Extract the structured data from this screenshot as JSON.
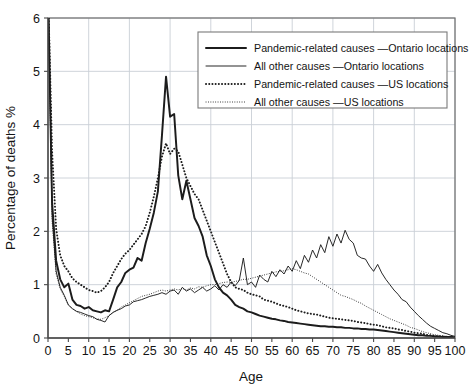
{
  "chart_data": {
    "type": "line",
    "title": "",
    "xlabel": "Age",
    "ylabel": "Percentage of deaths %",
    "xlim": [
      0,
      100
    ],
    "ylim": [
      0,
      6
    ],
    "xticks": [
      0,
      5,
      10,
      15,
      20,
      25,
      30,
      35,
      40,
      45,
      50,
      55,
      60,
      65,
      70,
      75,
      80,
      85,
      90,
      95,
      100
    ],
    "yticks": [
      0,
      1,
      2,
      3,
      4,
      5,
      6
    ],
    "xtick_labels": [
      "0",
      "5",
      "10",
      "15",
      "20",
      "25",
      "30",
      "35",
      "40",
      "45",
      "50",
      "55",
      "60",
      "65",
      "70",
      "75",
      "80",
      "85",
      "90",
      "95",
      "100"
    ],
    "ytick_labels": [
      "0",
      "1",
      "2",
      "3",
      "4",
      "5",
      "6"
    ],
    "grid": "both-major-10yr-and-1pct",
    "legend_position": "top-right-inside",
    "x": [
      0,
      1,
      2,
      3,
      4,
      5,
      6,
      7,
      8,
      9,
      10,
      11,
      12,
      13,
      14,
      15,
      16,
      17,
      18,
      19,
      20,
      21,
      22,
      23,
      24,
      25,
      26,
      27,
      28,
      29,
      30,
      31,
      32,
      33,
      34,
      35,
      36,
      37,
      38,
      39,
      40,
      41,
      42,
      43,
      44,
      45,
      46,
      47,
      48,
      49,
      50,
      51,
      52,
      53,
      54,
      55,
      56,
      57,
      58,
      59,
      60,
      61,
      62,
      63,
      64,
      65,
      66,
      67,
      68,
      69,
      70,
      71,
      72,
      73,
      74,
      75,
      76,
      77,
      78,
      79,
      80,
      81,
      82,
      83,
      84,
      85,
      86,
      87,
      88,
      89,
      90,
      91,
      92,
      93,
      94,
      95,
      96,
      97,
      98,
      99,
      100
    ],
    "series": [
      {
        "name": "Pandemic-related causes — Ontario locations",
        "style": "thick-solid",
        "color": "#1c1c1c",
        "values": [
          6.6,
          2.55,
          1.45,
          1.1,
          0.95,
          1.02,
          0.72,
          0.62,
          0.6,
          0.55,
          0.58,
          0.52,
          0.5,
          0.48,
          0.52,
          0.5,
          0.72,
          0.95,
          1.05,
          1.22,
          1.28,
          1.32,
          1.5,
          1.45,
          1.78,
          2.05,
          2.35,
          2.75,
          3.8,
          4.9,
          4.15,
          4.2,
          3.05,
          2.6,
          2.95,
          2.6,
          2.25,
          2.1,
          1.9,
          1.55,
          1.35,
          1.1,
          0.95,
          0.85,
          0.8,
          0.72,
          0.62,
          0.58,
          0.55,
          0.5,
          0.48,
          0.45,
          0.42,
          0.4,
          0.38,
          0.36,
          0.35,
          0.33,
          0.32,
          0.3,
          0.29,
          0.28,
          0.27,
          0.26,
          0.25,
          0.24,
          0.23,
          0.22,
          0.22,
          0.21,
          0.21,
          0.2,
          0.2,
          0.19,
          0.19,
          0.18,
          0.18,
          0.17,
          0.17,
          0.16,
          0.16,
          0.15,
          0.14,
          0.13,
          0.12,
          0.11,
          0.1,
          0.09,
          0.08,
          0.07,
          0.06,
          0.05,
          0.05,
          0.04,
          0.04,
          0.03,
          0.03,
          0.02,
          0.02,
          0.02,
          0.01
        ]
      },
      {
        "name": "All other causes — Ontario locations",
        "style": "thin-solid",
        "color": "#1c1c1c",
        "values": [
          6.6,
          2.3,
          1.25,
          0.95,
          0.8,
          0.62,
          0.55,
          0.5,
          0.48,
          0.45,
          0.42,
          0.4,
          0.35,
          0.33,
          0.3,
          0.42,
          0.48,
          0.52,
          0.55,
          0.6,
          0.62,
          0.68,
          0.7,
          0.72,
          0.75,
          0.78,
          0.8,
          0.82,
          0.85,
          0.82,
          0.88,
          0.9,
          0.82,
          0.95,
          0.88,
          0.92,
          0.85,
          0.9,
          0.95,
          0.88,
          0.92,
          0.98,
          0.9,
          1.0,
          0.95,
          1.05,
          0.98,
          1.08,
          1.5,
          1.0,
          1.05,
          0.95,
          1.18,
          1.1,
          1.05,
          1.25,
          1.15,
          1.28,
          1.2,
          1.35,
          1.25,
          1.45,
          1.3,
          1.55,
          1.42,
          1.65,
          1.5,
          1.75,
          1.6,
          1.9,
          1.72,
          1.95,
          1.78,
          2.02,
          1.85,
          1.78,
          1.55,
          1.5,
          1.48,
          1.35,
          1.25,
          1.38,
          1.22,
          1.1,
          1.0,
          0.9,
          0.82,
          0.72,
          0.68,
          0.58,
          0.5,
          0.42,
          0.35,
          0.28,
          0.22,
          0.18,
          0.14,
          0.1,
          0.08,
          0.05,
          0.03
        ]
      },
      {
        "name": "Pandemic-related causes — US locations",
        "style": "thick-dotted",
        "color": "#1c1c1c",
        "values": [
          6.6,
          3.5,
          2.05,
          1.55,
          1.35,
          1.25,
          1.12,
          1.05,
          1.0,
          0.95,
          0.9,
          0.88,
          0.85,
          0.88,
          0.95,
          1.05,
          1.22,
          1.35,
          1.48,
          1.58,
          1.65,
          1.75,
          1.85,
          1.95,
          2.1,
          2.35,
          2.65,
          3.0,
          3.4,
          3.65,
          3.45,
          3.55,
          3.5,
          3.25,
          3.0,
          2.85,
          2.7,
          2.6,
          2.4,
          2.2,
          2.0,
          1.8,
          1.6,
          1.4,
          1.2,
          1.05,
          0.95,
          0.92,
          0.9,
          0.85,
          0.82,
          0.8,
          0.78,
          0.72,
          0.7,
          0.68,
          0.65,
          0.62,
          0.6,
          0.58,
          0.55,
          0.52,
          0.5,
          0.48,
          0.46,
          0.45,
          0.44,
          0.42,
          0.4,
          0.38,
          0.37,
          0.36,
          0.35,
          0.34,
          0.33,
          0.32,
          0.3,
          0.29,
          0.28,
          0.26,
          0.25,
          0.24,
          0.22,
          0.2,
          0.19,
          0.18,
          0.16,
          0.15,
          0.13,
          0.12,
          0.1,
          0.09,
          0.08,
          0.06,
          0.05,
          0.04,
          0.03,
          0.03,
          0.02,
          0.02,
          0.01
        ]
      },
      {
        "name": "All other causes — US locations",
        "style": "thin-dotted",
        "color": "#1c1c1c",
        "values": [
          6.6,
          2.2,
          1.2,
          0.92,
          0.78,
          0.62,
          0.55,
          0.5,
          0.45,
          0.42,
          0.4,
          0.38,
          0.36,
          0.35,
          0.38,
          0.42,
          0.48,
          0.52,
          0.58,
          0.62,
          0.66,
          0.7,
          0.74,
          0.78,
          0.8,
          0.82,
          0.85,
          0.88,
          0.9,
          0.88,
          0.9,
          0.92,
          0.9,
          0.93,
          0.9,
          0.94,
          0.92,
          0.96,
          0.95,
          0.98,
          1.0,
          1.0,
          1.02,
          1.04,
          1.05,
          1.05,
          1.06,
          1.08,
          1.1,
          1.1,
          1.12,
          1.14,
          1.16,
          1.18,
          1.2,
          1.22,
          1.24,
          1.25,
          1.26,
          1.28,
          1.3,
          1.28,
          1.25,
          1.22,
          1.2,
          1.15,
          1.1,
          1.05,
          1.0,
          0.95,
          0.9,
          0.85,
          0.8,
          0.78,
          0.75,
          0.72,
          0.68,
          0.65,
          0.6,
          0.56,
          0.52,
          0.48,
          0.44,
          0.4,
          0.36,
          0.33,
          0.3,
          0.27,
          0.24,
          0.2,
          0.18,
          0.15,
          0.12,
          0.1,
          0.08,
          0.06,
          0.05,
          0.04,
          0.03,
          0.02,
          0.01
        ]
      }
    ],
    "legend_entries": [
      {
        "label": "Pandemic-related causes —Ontario locations",
        "style": "thick-solid"
      },
      {
        "label": "All other causes —Ontario locations",
        "style": "thin-solid"
      },
      {
        "label": "Pandemic-related causes —US locations",
        "style": "thick-dotted"
      },
      {
        "label": "All other causes —US locations",
        "style": "thin-dotted"
      }
    ]
  }
}
